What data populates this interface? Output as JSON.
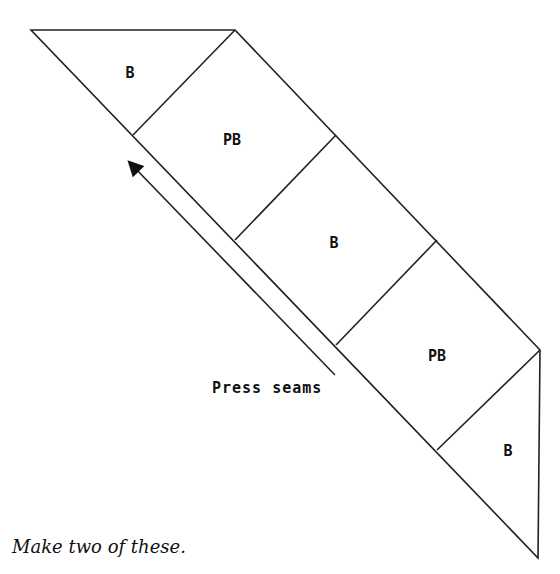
{
  "diagram": {
    "pieces": [
      {
        "label": "B",
        "shape": "triangle"
      },
      {
        "label": "PB",
        "shape": "square"
      },
      {
        "label": "B",
        "shape": "square"
      },
      {
        "label": "PB",
        "shape": "square"
      },
      {
        "label": "B",
        "shape": "triangle"
      }
    ],
    "arrow_label": "Press seams",
    "line_color": "#222222"
  },
  "caption": "Make two of these."
}
